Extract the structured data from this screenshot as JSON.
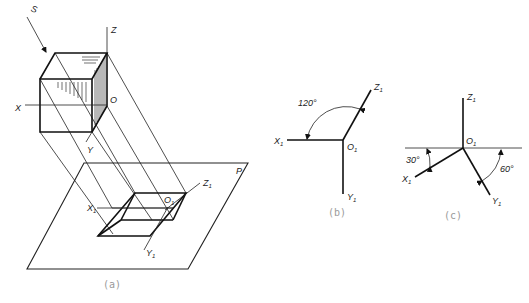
{
  "figure": {
    "panels": [
      {
        "id": "a",
        "caption": "(a)",
        "labels": {
          "projection_direction": "S",
          "axis_z": "Z",
          "axis_x": "X",
          "axis_y": "Y",
          "origin": "O",
          "axis_z1": "Z",
          "axis_x1": "X",
          "axis_y1": "Y",
          "origin1": "O",
          "subscript": "1",
          "plane": "P"
        }
      },
      {
        "id": "b",
        "caption": "(b)",
        "labels": {
          "angle": "120°",
          "axis_x1": "X",
          "axis_y1": "Y",
          "axis_z1": "Z",
          "origin1": "O",
          "subscript": "1"
        }
      },
      {
        "id": "c",
        "caption": "(c)",
        "labels": {
          "angle_left": "30°",
          "angle_right": "60°",
          "axis_x1": "X",
          "axis_y1": "Y",
          "axis_z1": "Z",
          "origin1": "O",
          "subscript": "1"
        }
      }
    ]
  }
}
